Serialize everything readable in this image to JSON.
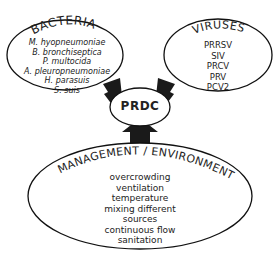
{
  "diagram": {
    "center": {
      "label": "PRDC"
    },
    "nodes": [
      {
        "id": "bacteria",
        "title": "BACTERIA",
        "items": [
          "M. hyopneumoniae",
          "B. bronchiseptica",
          "P. multocida",
          "A. pleuropneumoniae",
          "H. parasuis",
          "S. suis"
        ]
      },
      {
        "id": "viruses",
        "title": "VIRUSES",
        "items": [
          "PRRSV",
          "SIV",
          "PRCV",
          "PRV",
          "PCV2"
        ]
      },
      {
        "id": "management",
        "title": "MANAGEMENT / ENVIRONMENT",
        "items": [
          "overcrowding",
          "ventilation",
          "temperature",
          "mixing different",
          "sources",
          "continuous flow",
          "sanitation"
        ]
      }
    ],
    "edges": [
      {
        "from": "bacteria",
        "to": "PRDC"
      },
      {
        "from": "viruses",
        "to": "PRDC"
      },
      {
        "from": "management",
        "to": "PRDC"
      }
    ],
    "colors": {
      "stroke": "#111111",
      "arrow": "#1a1a1a",
      "background": "#ffffff"
    }
  }
}
